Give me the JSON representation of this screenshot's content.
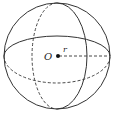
{
  "diagram": {
    "type": "sphere",
    "center_label": "O",
    "radius_label": "r",
    "caption": "",
    "colors": {
      "stroke": "#333333",
      "point": "#111111",
      "background": "#ffffff"
    }
  }
}
